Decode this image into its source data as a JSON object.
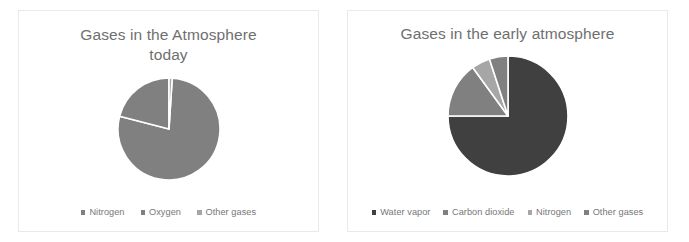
{
  "page": {
    "background": "#ffffff",
    "panel_border_color": "#e9e9e9"
  },
  "colors": {
    "dark_gray": "#404040",
    "mid_gray": "#808080",
    "light_gray": "#a6a6a6",
    "title_text": "#6f6f6f",
    "legend_text": "#777777",
    "slice_outline": "#ffffff"
  },
  "charts": [
    {
      "id": "gases-today",
      "title": "Gases in the Atmosphere today",
      "title_line1": "Gases in the Atmosphere",
      "title_line2": "today"
    },
    {
      "id": "gases-early",
      "title": "Gases in the early atmosphere"
    }
  ],
  "chart_data": [
    {
      "type": "pie",
      "title": "Gases in the Atmosphere today",
      "xlabel": "",
      "ylabel": "",
      "legend_position": "bottom",
      "grid": false,
      "categories": [
        "Nitrogen",
        "Oxygen",
        "Other gases"
      ],
      "values": [
        78,
        21,
        1
      ],
      "units": "%",
      "colors": [
        "#808080",
        "#808080",
        "#a6a6a6"
      ],
      "start_angle_deg": 0,
      "direction": "clockwise",
      "slices": [
        {
          "label": "Nitrogen",
          "value": 78,
          "color": "#808080",
          "start_deg": 3.6,
          "end_deg": 284.4
        },
        {
          "label": "Oxygen",
          "value": 21,
          "color": "#808080",
          "start_deg": 284.4,
          "end_deg": 360.0
        },
        {
          "label": "Other gases",
          "value": 1,
          "color": "#a6a6a6",
          "start_deg": 0.0,
          "end_deg": 3.6
        }
      ]
    },
    {
      "type": "pie",
      "title": "Gases in the early atmosphere",
      "xlabel": "",
      "ylabel": "",
      "legend_position": "bottom",
      "grid": false,
      "categories": [
        "Water vapor",
        "Carbon dioxide",
        "Nitrogen",
        "Other gases"
      ],
      "values": [
        75,
        15,
        5,
        5
      ],
      "units": "%",
      "colors": [
        "#404040",
        "#808080",
        "#a6a6a6",
        "#808080"
      ],
      "start_angle_deg": 0,
      "direction": "clockwise",
      "slices": [
        {
          "label": "Water vapor",
          "value": 75,
          "color": "#404040",
          "start_deg": 0.0,
          "end_deg": 270.0
        },
        {
          "label": "Carbon dioxide",
          "value": 15,
          "color": "#808080",
          "start_deg": 270.0,
          "end_deg": 324.0
        },
        {
          "label": "Nitrogen",
          "value": 5,
          "color": "#a6a6a6",
          "start_deg": 324.0,
          "end_deg": 342.0
        },
        {
          "label": "Other gases",
          "value": 5,
          "color": "#808080",
          "start_deg": 342.0,
          "end_deg": 360.0
        }
      ]
    }
  ],
  "legends": {
    "today": [
      {
        "label": "Nitrogen",
        "color": "#808080"
      },
      {
        "label": "Oxygen",
        "color": "#808080"
      },
      {
        "label": "Other gases",
        "color": "#a6a6a6"
      }
    ],
    "early": [
      {
        "label": "Water vapor",
        "color": "#404040"
      },
      {
        "label": "Carbon dioxide",
        "color": "#808080"
      },
      {
        "label": "Nitrogen",
        "color": "#a6a6a6"
      },
      {
        "label": "Other gases",
        "color": "#808080"
      }
    ]
  }
}
